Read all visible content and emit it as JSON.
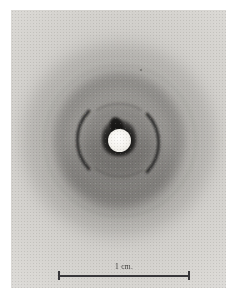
{
  "figure": {
    "type": "x-ray-diffraction-photograph",
    "caption_label": "1 cm.",
    "medium": "photographic print",
    "colors": {
      "page_background": "#ffffff",
      "print_edge": "#dededc",
      "film_light": "#e2e0dd",
      "film_mid": "#c5c3bf",
      "film_dark": "#6f6d6a",
      "arc_dark": "#232221",
      "beamstop_white": "#f6f4f0",
      "ink": "#38373a"
    }
  },
  "print": {
    "x": 11,
    "y": 10,
    "width": 215,
    "height": 278
  },
  "pattern": {
    "center_x": 118,
    "center_y": 140,
    "beamstop_radius_px": 11,
    "arc_radius_px": 42,
    "outer_halo_radius_px": 98,
    "features": [
      {
        "name": "beamstop-disc",
        "description": "bright white circular beamstop at pattern centre"
      },
      {
        "name": "beamstop-holder-shadow",
        "description": "dark shadow of the beamstop arm above the disc"
      },
      {
        "name": "left-reflection-arc",
        "description": "dark crescent arc on the left at constant radius"
      },
      {
        "name": "right-reflection-arc",
        "description": "dark crescent arc on the right at constant radius"
      },
      {
        "name": "diffuse-halo",
        "description": "broad diffuse concentric halo of scattered intensity"
      },
      {
        "name": "lower-dark-lobe",
        "description": "darker diffuse region below the pattern centre"
      }
    ]
  },
  "scale_bar": {
    "label": "1 cm.",
    "length_px": 132,
    "left_x": 58,
    "right_x": 190,
    "y": 275,
    "value": 1,
    "unit": "cm"
  }
}
